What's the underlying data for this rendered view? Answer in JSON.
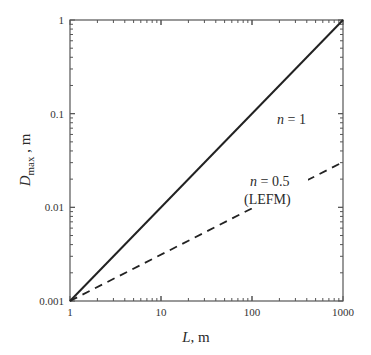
{
  "chart_data": {
    "type": "line",
    "title": "",
    "xlabel": "L, m",
    "ylabel": "D_max, m",
    "xscale": "log",
    "yscale": "log",
    "xlim": [
      1,
      1000
    ],
    "ylim": [
      0.001,
      1
    ],
    "x_ticks": [
      "1",
      "10",
      "100",
      "1000"
    ],
    "y_ticks": [
      "0.001",
      "0.01",
      "0.1",
      "1"
    ],
    "grid": false,
    "legend": null,
    "series": [
      {
        "name": "n = 1",
        "style": "solid",
        "x": [
          1,
          10,
          100,
          1000
        ],
        "y": [
          0.001,
          0.01,
          0.1,
          1
        ]
      },
      {
        "name": "n = 0.5 (LEFM)",
        "style": "dashed",
        "x": [
          1,
          10,
          100,
          1000
        ],
        "y": [
          0.001,
          0.00316,
          0.01,
          0.0316
        ]
      }
    ],
    "annotations": [
      {
        "text": "n = 1",
        "near": [
          150,
          0.15
        ]
      },
      {
        "text": "n = 0.5",
        "near": [
          120,
          0.012
        ]
      },
      {
        "text": "(LEFM)",
        "near": [
          120,
          0.0065
        ]
      }
    ]
  },
  "labels": {
    "xlabel_var": "L",
    "xlabel_unit": ", m",
    "ylabel_var": "D",
    "ylabel_sub": "max",
    "ylabel_unit": " , m",
    "annot_n1_var": "n",
    "annot_n1_rest": " = 1",
    "annot_n05_var": "n",
    "annot_n05_rest": " = 0.5",
    "annot_lefm": "(LEFM)",
    "xt1": "1",
    "xt10": "10",
    "xt100": "100",
    "xt1000": "1000",
    "yt1": "1",
    "yt01": "0.1",
    "yt001": "0.01",
    "yt0001": "0.001"
  }
}
